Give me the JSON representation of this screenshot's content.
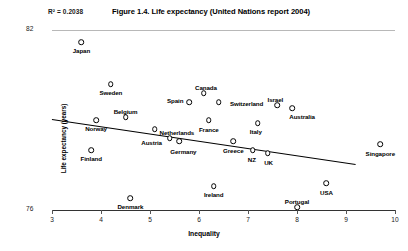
{
  "chart_data": {
    "type": "scatter",
    "title": "Figure 1.4. Life expectancy (United Nations report 2004)",
    "annotation_r2": "R² = 0.2038",
    "xlabel": "Inequality",
    "ylabel": "Life expectancy (years)",
    "xlim": [
      3,
      10
    ],
    "ylim": [
      76,
      82
    ],
    "xticks": [
      3,
      4,
      5,
      6,
      7,
      8,
      9,
      10
    ],
    "xtick_labels": [
      "3",
      "4",
      "5",
      "6",
      "7",
      "8",
      "9",
      "10"
    ],
    "yticks": [
      76,
      82
    ],
    "ytick_labels": [
      "76",
      "82"
    ],
    "grid": false,
    "legend": null,
    "trendline": {
      "visible": true,
      "x_start": 3.0,
      "y_start": 79.05,
      "x_end": 9.2,
      "y_end": 77.55
    },
    "points": [
      {
        "name": "Japan",
        "x": 3.6,
        "y": 81.6,
        "label_dx": 0,
        "label_dy": 8
      },
      {
        "name": "Sweden",
        "x": 4.2,
        "y": 80.2,
        "label_dx": 0,
        "label_dy": 8
      },
      {
        "name": "Norway",
        "x": 3.9,
        "y": 79.0,
        "label_dx": 0,
        "label_dy": 8
      },
      {
        "name": "Finland",
        "x": 3.8,
        "y": 78.0,
        "label_dx": 0,
        "label_dy": 8
      },
      {
        "name": "Belgium",
        "x": 4.5,
        "y": 79.1,
        "label_dx": 0,
        "label_dy": -6
      },
      {
        "name": "Netherlands",
        "x": 5.1,
        "y": 78.7,
        "label_dx": 22,
        "label_dy": 3
      },
      {
        "name": "Austria",
        "x": 5.4,
        "y": 78.4,
        "label_dx": -18,
        "label_dy": 4
      },
      {
        "name": "Germany",
        "x": 5.6,
        "y": 78.3,
        "label_dx": 4,
        "label_dy": 10
      },
      {
        "name": "Spain",
        "x": 5.8,
        "y": 79.6,
        "label_dx": -14,
        "label_dy": -2
      },
      {
        "name": "Canada",
        "x": 6.1,
        "y": 79.9,
        "label_dx": 2,
        "label_dy": -6
      },
      {
        "name": "Switzerland",
        "x": 6.4,
        "y": 79.6,
        "label_dx": 28,
        "label_dy": 1
      },
      {
        "name": "France",
        "x": 6.2,
        "y": 79.0,
        "label_dx": 0,
        "label_dy": 9
      },
      {
        "name": "Denmark",
        "x": 4.6,
        "y": 76.4,
        "label_dx": 0,
        "label_dy": 8
      },
      {
        "name": "Ireland",
        "x": 6.3,
        "y": 76.8,
        "label_dx": 0,
        "label_dy": 8
      },
      {
        "name": "Greece",
        "x": 6.7,
        "y": 78.3,
        "label_dx": 0,
        "label_dy": 9
      },
      {
        "name": "NZ",
        "x": 7.1,
        "y": 78.0,
        "label_dx": -1,
        "label_dy": 9
      },
      {
        "name": "UK",
        "x": 7.4,
        "y": 77.9,
        "label_dx": 1,
        "label_dy": 9
      },
      {
        "name": "Italy",
        "x": 7.2,
        "y": 78.9,
        "label_dx": -2,
        "label_dy": 8
      },
      {
        "name": "Israel",
        "x": 7.6,
        "y": 79.5,
        "label_dx": -2,
        "label_dy": -6
      },
      {
        "name": "Australia",
        "x": 7.9,
        "y": 79.4,
        "label_dx": 10,
        "label_dy": 8
      },
      {
        "name": "Portugal",
        "x": 8.0,
        "y": 76.1,
        "label_dx": 0,
        "label_dy": -6
      },
      {
        "name": "USA",
        "x": 8.6,
        "y": 76.9,
        "label_dx": 0,
        "label_dy": 9
      },
      {
        "name": "Singapore",
        "x": 9.7,
        "y": 78.2,
        "label_dx": 0,
        "label_dy": 9
      }
    ]
  }
}
